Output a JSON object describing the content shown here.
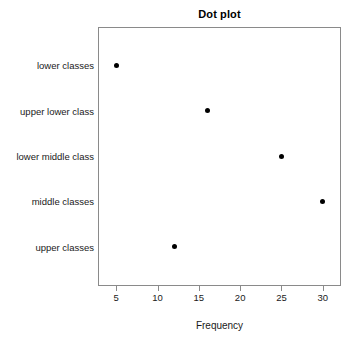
{
  "chart_data": {
    "type": "scatter",
    "title": "Dot plot",
    "xlabel": "Frequency",
    "ylabel": "",
    "categories": [
      "lower classes",
      "upper lower class",
      "lower middle class",
      "middle classes",
      "upper classes"
    ],
    "values": [
      5,
      16,
      25,
      30,
      12
    ],
    "xlim": [
      2.8,
      32.2
    ],
    "xticks": [
      5,
      10,
      15,
      20,
      25,
      30
    ],
    "xtick_labels": [
      "5",
      "10",
      "15",
      "20",
      "25",
      "30"
    ],
    "grid": false,
    "legend": null,
    "point_color": "#000000",
    "panel_border_color": "#8a8a8a",
    "background_color": "#ffffff"
  }
}
